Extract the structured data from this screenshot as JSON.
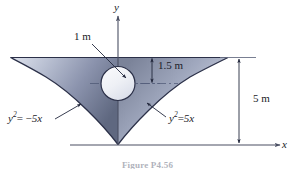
{
  "figure": {
    "caption": "Figure P4.56",
    "axes": {
      "y_label": "y",
      "x_label": "x"
    },
    "dimensions": [
      {
        "name": "circle-diameter",
        "text": "1 m",
        "value": 1,
        "unit": "m"
      },
      {
        "name": "circle-offset-from-top",
        "text": "1.5 m",
        "value": 1.5,
        "unit": "m"
      },
      {
        "name": "overall-height",
        "text": "5 m",
        "value": 5,
        "unit": "m"
      }
    ],
    "curves": [
      {
        "name": "left-parabola",
        "base": "y",
        "exponent": "2",
        "operator": "= −",
        "rhs": "5x"
      },
      {
        "name": "right-parabola",
        "base": "y",
        "exponent": "2",
        "operator": "=",
        "rhs": "5x"
      }
    ],
    "colors": {
      "shape_fill_light": "#e8ebf2",
      "shape_fill_mid": "#9aa3bb",
      "shape_fill_dark": "#5d6782",
      "outline": "#2b3048",
      "axis": "#4a4f63",
      "text": "#1b1b28",
      "background": "#ffffff"
    }
  }
}
